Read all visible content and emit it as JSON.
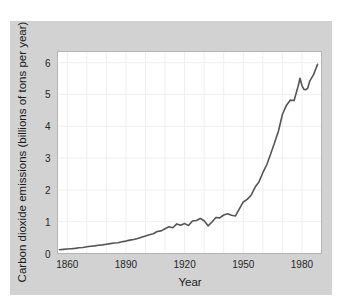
{
  "figure": {
    "background_color": "#ffffff",
    "panel_color": "#d2d2d2",
    "plot_color": "#ffffff",
    "line_color": "#555555",
    "grid_color": "#efefef",
    "border_color": "#b4b4b4",
    "text_color": "#262626"
  },
  "chart_data": {
    "type": "line",
    "title": "",
    "subtitle": "",
    "xlabel": "Year",
    "ylabel": "Carbon dioxide emissions (billions of tons per year)",
    "xlim": [
      1855,
      1990
    ],
    "ylim": [
      0,
      6.35
    ],
    "grid": true,
    "legend": false,
    "legend_position": "none",
    "xticks": [
      1860,
      1890,
      1920,
      1950,
      1980
    ],
    "xtick_labels": [
      "1860",
      "1890",
      "1920",
      "1950",
      "1980"
    ],
    "x_minor_gridlines": [
      1860,
      1870,
      1880,
      1890,
      1900,
      1910,
      1920,
      1930,
      1940,
      1950,
      1960,
      1970,
      1980
    ],
    "yticks": [
      0,
      1,
      2,
      3,
      4,
      5,
      6
    ],
    "ytick_labels": [
      "0",
      "1",
      "2",
      "3",
      "4",
      "5",
      "6"
    ],
    "series": [
      {
        "name": "Carbon dioxide emissions",
        "x": [
          1856,
          1858,
          1860,
          1862,
          1864,
          1866,
          1868,
          1870,
          1872,
          1874,
          1876,
          1878,
          1880,
          1882,
          1884,
          1886,
          1888,
          1890,
          1892,
          1894,
          1896,
          1898,
          1900,
          1902,
          1904,
          1906,
          1908,
          1910,
          1912,
          1914,
          1916,
          1918,
          1920,
          1922,
          1924,
          1926,
          1928,
          1930,
          1932,
          1934,
          1936,
          1938,
          1940,
          1942,
          1944,
          1946,
          1948,
          1950,
          1952,
          1954,
          1956,
          1958,
          1960,
          1962,
          1964,
          1966,
          1968,
          1970,
          1972,
          1974,
          1976,
          1978,
          1979,
          1980,
          1981,
          1982,
          1983,
          1984,
          1986,
          1988
        ],
        "values": [
          0.12,
          0.13,
          0.14,
          0.15,
          0.16,
          0.18,
          0.19,
          0.21,
          0.23,
          0.24,
          0.26,
          0.27,
          0.29,
          0.31,
          0.33,
          0.34,
          0.37,
          0.39,
          0.42,
          0.44,
          0.47,
          0.51,
          0.55,
          0.59,
          0.62,
          0.69,
          0.71,
          0.78,
          0.84,
          0.81,
          0.93,
          0.89,
          0.94,
          0.88,
          1.02,
          1.04,
          1.1,
          1.03,
          0.87,
          0.99,
          1.13,
          1.12,
          1.21,
          1.25,
          1.2,
          1.18,
          1.4,
          1.62,
          1.7,
          1.83,
          2.08,
          2.25,
          2.54,
          2.79,
          3.13,
          3.48,
          3.85,
          4.37,
          4.65,
          4.82,
          4.81,
          5.25,
          5.51,
          5.28,
          5.16,
          5.15,
          5.2,
          5.42,
          5.63,
          5.95
        ]
      }
    ]
  }
}
